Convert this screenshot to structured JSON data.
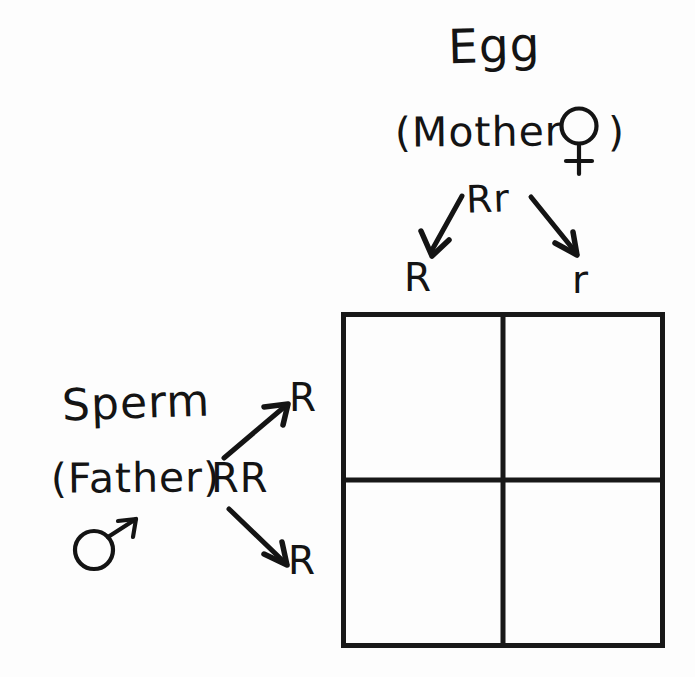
{
  "diagram": {
    "kind": "punnett-square",
    "background_color": "#fdfdfd",
    "ink_color": "#141414"
  },
  "egg_side": {
    "title": "Egg",
    "parent_label": "(Mother",
    "parent_label_close": ")",
    "sex_symbol": "female-symbol",
    "genotype": "Rr",
    "alleles": [
      "R",
      "r"
    ]
  },
  "sperm_side": {
    "title": "Sperm",
    "parent_label": "(Father)",
    "sex_symbol": "male-symbol",
    "genotype": "RR",
    "alleles": [
      "R",
      "R"
    ]
  },
  "punnett_grid": {
    "rows": 2,
    "columns": 2,
    "column_headers": [
      "R",
      "r"
    ],
    "row_headers": [
      "R",
      "R"
    ],
    "cells": [
      [
        "",
        ""
      ],
      [
        "",
        ""
      ]
    ]
  }
}
